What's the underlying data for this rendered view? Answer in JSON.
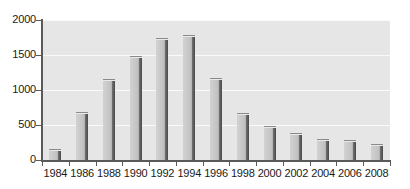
{
  "chart_data": {
    "type": "bar",
    "title": "",
    "subtitle": "",
    "xlabel": "",
    "ylabel": "",
    "categories": [
      "1984",
      "1986",
      "1988",
      "1990",
      "1992",
      "1994",
      "1996",
      "1998",
      "2000",
      "2002",
      "2004",
      "2006",
      "2008"
    ],
    "values": [
      155,
      690,
      1160,
      1480,
      1740,
      1780,
      1170,
      670,
      490,
      380,
      295,
      285,
      235
    ],
    "ylim": [
      0,
      2000
    ],
    "yticks": [
      0,
      500,
      1000,
      1500,
      2000
    ],
    "ytick_labels": [
      "0",
      "500",
      "1000",
      "1500",
      "2000"
    ],
    "grid": true,
    "grid_axis": "y",
    "legend": null,
    "legend_position": "none",
    "annotations": [],
    "series": [
      {
        "name": "",
        "values": [
          155,
          690,
          1160,
          1480,
          1740,
          1780,
          1170,
          670,
          490,
          380,
          295,
          285,
          235
        ]
      }
    ]
  },
  "style": {
    "plot_background": "#e6e6e6",
    "page_background": "#ffffff",
    "gridline_color": "#fafafa",
    "axis_color": "#5a5a5a",
    "bar_face_color": "#c4c4c4",
    "bar_edge_color": "#4a4a4a",
    "text_color": "#1a1a1a"
  }
}
